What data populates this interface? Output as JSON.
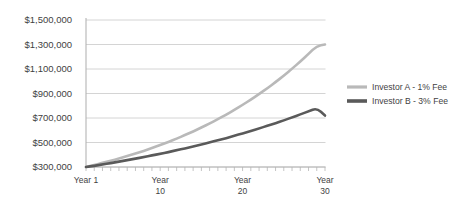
{
  "chart_data": {
    "type": "line",
    "title": "",
    "subtitle": "",
    "xlabel": "",
    "ylabel": "",
    "grid": true,
    "legend_position": "right",
    "ylim": [
      300000,
      1500000
    ],
    "xlim": [
      1,
      30
    ],
    "y_ticks": [
      300000,
      500000,
      700000,
      900000,
      1100000,
      1300000,
      1500000
    ],
    "y_tick_labels": [
      "$300,000",
      "$500,000",
      "$700,000",
      "$900,000",
      "$1,100,000",
      "$1,300,000",
      "$1,500,000"
    ],
    "x_ticks": [
      1,
      10,
      20,
      30
    ],
    "x_tick_labels": [
      "Year 1",
      "Year\n10",
      "Year\n20",
      "Year\n30"
    ],
    "x_tick_lines": [
      [
        "Year 1",
        ""
      ],
      [
        "Year",
        "10"
      ],
      [
        "Year",
        "20"
      ],
      [
        "Year",
        "30"
      ]
    ],
    "x": [
      1,
      2,
      3,
      4,
      5,
      6,
      7,
      8,
      9,
      10,
      11,
      12,
      13,
      14,
      15,
      16,
      17,
      18,
      19,
      20,
      21,
      22,
      23,
      24,
      25,
      26,
      27,
      28,
      29,
      30
    ],
    "series": [
      {
        "name": "Investor A - 1% Fee",
        "color": "#b9b9b9",
        "values": [
          300000,
          316000,
          333000,
          351000,
          369000,
          389000,
          410000,
          432000,
          455000,
          479000,
          505000,
          532000,
          560000,
          590000,
          622000,
          655000,
          690000,
          727000,
          766000,
          807000,
          850000,
          895000,
          943000,
          993000,
          1046000,
          1102000,
          1161000,
          1223000,
          1289000,
          1300000
        ]
      },
      {
        "name": "Investor B - 3% Fee",
        "color": "#5a5a5a",
        "values": [
          300000,
          310000,
          321000,
          332000,
          344000,
          356000,
          368000,
          381000,
          394000,
          408000,
          422000,
          437000,
          452000,
          468000,
          484000,
          501000,
          518000,
          536000,
          555000,
          574000,
          594000,
          615000,
          636000,
          658000,
          681000,
          705000,
          729000,
          755000,
          781000,
          720000
        ]
      }
    ],
    "legend": [
      {
        "label": "Investor A - 1% Fee",
        "color": "#b9b9b9"
      },
      {
        "label": "Investor B - 3% Fee",
        "color": "#5a5a5a"
      }
    ],
    "colors": {
      "gridline": "#cfcfcf",
      "axis": "#b5b5b5",
      "text": "#3f3f3f",
      "background": "#ffffff"
    }
  }
}
